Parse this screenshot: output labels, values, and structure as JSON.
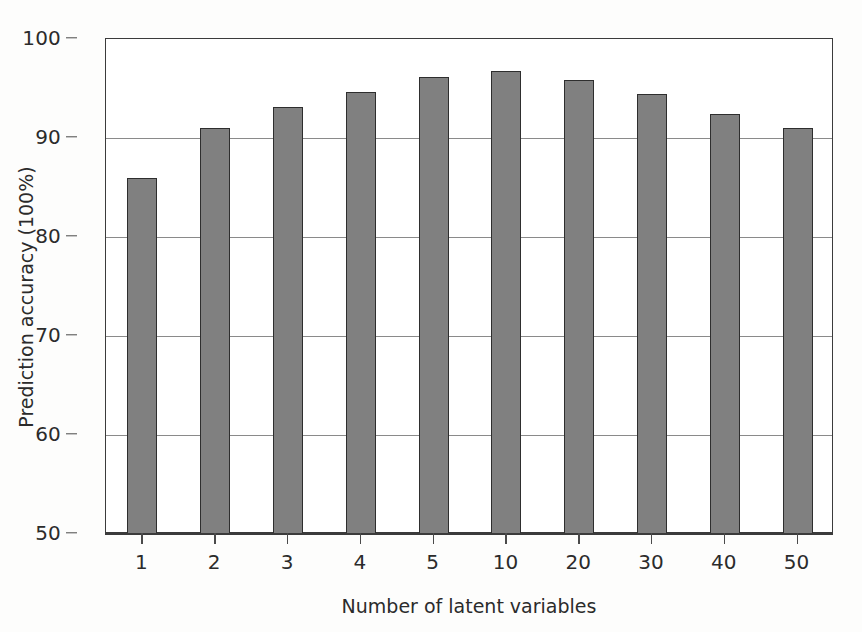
{
  "chart_data": {
    "type": "bar",
    "title": "",
    "xlabel": "Number of latent variables",
    "ylabel": "Prediction accuracy (100%)",
    "categories": [
      "1",
      "2",
      "3",
      "4",
      "5",
      "10",
      "20",
      "30",
      "40",
      "50"
    ],
    "values": [
      86.0,
      91.0,
      93.1,
      94.6,
      96.2,
      96.8,
      95.9,
      94.4,
      92.4,
      91.0
    ],
    "ylim": [
      50,
      100
    ],
    "y_ticks": [
      50,
      60,
      70,
      80,
      90,
      100
    ],
    "y_tick_labels": [
      "50",
      "60",
      "70",
      "80",
      "90",
      "100"
    ],
    "grid": true,
    "grid_axis": "y",
    "legend": false,
    "bar_color": "#808080",
    "bar_edge_color": "#2e2e2e",
    "axis_color": "#3b3b3b",
    "background_color": "#ffffff"
  }
}
